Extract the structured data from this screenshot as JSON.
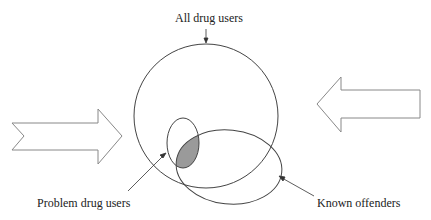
{
  "diagram": {
    "labels": {
      "all_drug_users": "All drug users",
      "problem_drug_users": "Problem drug users",
      "known_offenders": "Known offenders"
    },
    "shapes": [
      {
        "id": "all-drug-users-circle",
        "type": "circle"
      },
      {
        "id": "problem-drug-users-ellipse",
        "type": "ellipse"
      },
      {
        "id": "known-offenders-ellipse",
        "type": "ellipse"
      },
      {
        "id": "overlap-region",
        "type": "shaded-intersection",
        "fill": "#9a9a9a"
      },
      {
        "id": "left-arrow",
        "type": "block-arrow",
        "direction": "right"
      },
      {
        "id": "right-arrow",
        "type": "block-arrow",
        "direction": "left"
      }
    ],
    "colors": {
      "stroke": "#444444",
      "arrow_stroke": "#888888",
      "shade": "#9a9a9a"
    }
  }
}
